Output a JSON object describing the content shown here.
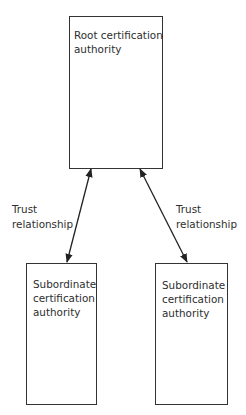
{
  "diagram": {
    "type": "hierarchy",
    "nodes": [
      {
        "id": "root",
        "label": "Root certification\nauthority"
      },
      {
        "id": "sub_left",
        "label": "Subordinate\ncertification\nauthority"
      },
      {
        "id": "sub_right",
        "label": "Subordinate\ncertification\nauthority"
      }
    ],
    "edges": [
      {
        "from": "root",
        "to": "sub_left",
        "label": "Trust\nrelationship",
        "direction": "bidirectional"
      },
      {
        "from": "root",
        "to": "sub_right",
        "label": "Trust\nrelationship",
        "direction": "bidirectional"
      }
    ],
    "colors": {
      "stroke": "#333333",
      "text": "#2e2e2e",
      "background": "#ffffff"
    }
  }
}
